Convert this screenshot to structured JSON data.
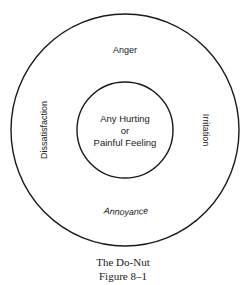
{
  "diagram": {
    "type": "concentric-circles",
    "title": "The Do-Nut",
    "outer_ring": {
      "labels": {
        "top": "Anger",
        "right": "Irritation",
        "bottom": "Annoyance",
        "left": "Dissatisfaction"
      }
    },
    "inner_circle": {
      "lines": [
        "Any Hurting",
        "or",
        "Painful Feeling"
      ]
    },
    "colors": {
      "stroke": "#1a1a1a",
      "background": "#ffffff",
      "text": "#1a1a1a"
    }
  },
  "caption": {
    "title": "The Do-Nut",
    "figure_number": "Figure 8–1"
  }
}
